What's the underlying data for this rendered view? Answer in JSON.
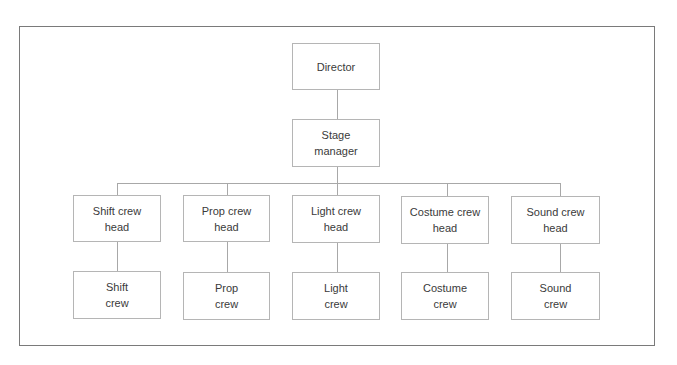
{
  "diagram": {
    "type": "org-chart",
    "root": {
      "label": "Director",
      "children": [
        {
          "label": "Stage manager",
          "children": [
            {
              "label": "Shift crew head",
              "children": [
                {
                  "label": "Shift crew"
                }
              ]
            },
            {
              "label": "Prop crew head",
              "children": [
                {
                  "label": "Prop crew"
                }
              ]
            },
            {
              "label": "Light crew head",
              "children": [
                {
                  "label": "Light crew"
                }
              ]
            },
            {
              "label": "Costume crew head",
              "children": [
                {
                  "label": "Costume crew"
                }
              ]
            },
            {
              "label": "Sound crew head",
              "children": [
                {
                  "label": "Sound crew"
                }
              ]
            }
          ]
        }
      ]
    }
  },
  "nodes": {
    "director": "Director",
    "stage_manager": "Stage\nmanager",
    "heads": [
      "Shift crew\nhead",
      "Prop crew\nhead",
      "Light crew\nhead",
      "Costume crew\nhead",
      "Sound crew\nhead"
    ],
    "crews": [
      "Shift\ncrew",
      "Prop\ncrew",
      "Light\ncrew",
      "Costume\ncrew",
      "Sound\ncrew"
    ]
  }
}
